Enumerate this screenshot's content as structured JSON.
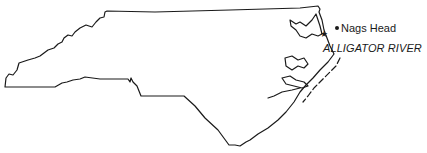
{
  "map": {
    "region": "North Carolina",
    "outline_color": "#1a1a1a",
    "background": "#ffffff",
    "markers": [
      {
        "type": "point",
        "label": "Nags Head",
        "icon": "dot-icon"
      },
      {
        "type": "star",
        "label": "ALLIGATOR RIVER",
        "icon": "star-icon"
      }
    ]
  },
  "labels": {
    "city": "Nags Head",
    "site": "ALLIGATOR RIVER"
  }
}
